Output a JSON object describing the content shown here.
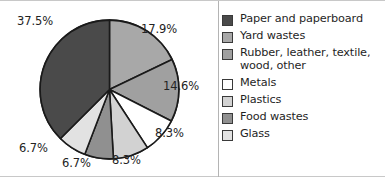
{
  "figure": {
    "frame_color": "#c8c8c8",
    "background": "#ffffff"
  },
  "chart_data": {
    "type": "pie",
    "title": "",
    "xlabel": "",
    "ylabel": "",
    "units": "percent",
    "legend_position": "right",
    "grid": false,
    "start_angle_deg": 0,
    "direction": "clockwise",
    "categories": [
      "Yard wastes",
      "Rubber, leather, textile, wood, other",
      "Metals",
      "Plastics",
      "Food wastes",
      "Glass",
      "Paper and paperboard"
    ],
    "values": [
      17.9,
      14.6,
      8.3,
      8.3,
      6.7,
      6.7,
      37.5
    ],
    "labels": [
      "17.9%",
      "14.6%",
      "8.3%",
      "8.3%",
      "6.7%",
      "6.7%",
      "37.5%"
    ],
    "colors": [
      "#a8a8a8",
      "#a0a0a0",
      "#ffffff",
      "#d2d2d2",
      "#909090",
      "#e2e2e2",
      "#4a4a4a"
    ],
    "slice_edge_color": "#1a1a1a"
  },
  "chart": {
    "slices": [
      {
        "name": "yard-wastes",
        "label": "17.9%",
        "value": 17.9,
        "color": "#a8a8a8",
        "label_left": "141px",
        "label_top": "21px"
      },
      {
        "name": "rubber-leather-textile-wood-other",
        "label": "14.6%",
        "value": 14.6,
        "color": "#a0a0a0",
        "label_left": "163px",
        "label_top": "78px"
      },
      {
        "name": "metals",
        "label": "8.3%",
        "value": 8.3,
        "color": "#ffffff",
        "label_left": "155px",
        "label_top": "125px"
      },
      {
        "name": "plastics",
        "label": "8.3%",
        "value": 8.3,
        "color": "#d2d2d2",
        "label_left": "112px",
        "label_top": "152px"
      },
      {
        "name": "food-wastes",
        "label": "6.7%",
        "value": 6.7,
        "color": "#909090",
        "label_left": "62px",
        "label_top": "155px"
      },
      {
        "name": "glass",
        "label": "6.7%",
        "value": 6.7,
        "color": "#e2e2e2",
        "label_left": "19px",
        "label_top": "140px"
      },
      {
        "name": "paper-and-paperboard",
        "label": "37.5%",
        "value": 37.5,
        "color": "#4a4a4a",
        "label_left": "17px",
        "label_top": "13px"
      }
    ]
  },
  "legend": {
    "items": [
      {
        "label": "Paper and paperboard",
        "color": "#4a4a4a",
        "name": "paper-and-paperboard"
      },
      {
        "label": "Yard wastes",
        "color": "#a8a8a8",
        "name": "yard-wastes"
      },
      {
        "label": "Rubber, leather, textile,\nwood, other",
        "color": "#a0a0a0",
        "name": "rubber-leather-textile-wood-other"
      },
      {
        "label": "Metals",
        "color": "#ffffff",
        "name": "metals"
      },
      {
        "label": "Plastics",
        "color": "#d2d2d2",
        "name": "plastics"
      },
      {
        "label": "Food wastes",
        "color": "#909090",
        "name": "food-wastes"
      },
      {
        "label": "Glass",
        "color": "#e2e2e2",
        "name": "glass"
      }
    ]
  }
}
